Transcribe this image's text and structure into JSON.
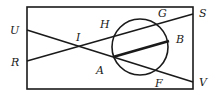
{
  "diagram": {
    "type": "geometry-figure",
    "colors": {
      "stroke": "#1a1a1a",
      "background": "#ffffff"
    },
    "rectangle": {
      "x1": 27,
      "y1": 7,
      "x2": 193,
      "y2": 89
    },
    "circle": {
      "cx": 140,
      "cy": 47,
      "r": 28
    },
    "points": {
      "U": {
        "x": 27,
        "y": 30
      },
      "R": {
        "x": 27,
        "y": 61
      },
      "S": {
        "x": 193,
        "y": 14
      },
      "V": {
        "x": 193,
        "y": 82
      },
      "I": {
        "x": 81,
        "y": 47
      },
      "A": {
        "x": 113,
        "y": 57
      },
      "B": {
        "x": 169,
        "y": 41
      },
      "G": {
        "x": 160,
        "y": 21
      },
      "F": {
        "x": 157,
        "y": 71
      },
      "H": {
        "x": 113,
        "y": 37
      }
    },
    "segments": [
      {
        "from": "R",
        "to": "S"
      },
      {
        "from": "U",
        "to": "V"
      },
      {
        "from": "A",
        "to": "B",
        "thick": true
      }
    ],
    "labels": {
      "U": "U",
      "R": "R",
      "H": "H",
      "I": "I",
      "G": "G",
      "S": "S",
      "B": "B",
      "A": "A",
      "F": "F",
      "V": "V"
    }
  }
}
